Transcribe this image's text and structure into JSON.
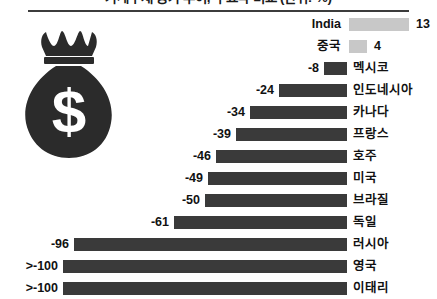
{
  "title": "가계부채 증가 추이, 주요국 비교 (단위: %)",
  "icon": {
    "money_bag": "money-bag-icon",
    "dollar_glyph": "$"
  },
  "axis": {
    "zero_x_px": 347,
    "px_per_unit_negative": 2.84,
    "px_per_unit_positive": 4.6
  },
  "colors": {
    "positive_bar": "#c8c8c8",
    "negative_bar": "#3a3a3a",
    "text": "#111111",
    "rule": "#3c3c3c",
    "background": "#ffffff"
  },
  "chart_data": {
    "type": "bar",
    "title": "가계부채 증가 추이, 주요국 비교 (단위: %)",
    "orientation": "horizontal",
    "xlabel": "",
    "ylabel": "",
    "grid": false,
    "legend": "none",
    "xlim": [
      -100,
      15
    ],
    "categories": [
      "India",
      "중국",
      "멕시코",
      "인도네시아",
      "카나다",
      "프랑스",
      "호주",
      "미국",
      "브라질",
      "독일",
      "러시아",
      "영국",
      "이태리"
    ],
    "values": [
      13,
      4,
      -8,
      -24,
      -34,
      -39,
      -46,
      -49,
      -50,
      -61,
      -96,
      -100,
      -100
    ],
    "value_labels": [
      "13",
      "4",
      "-8",
      "-24",
      "-34",
      "-39",
      "-46",
      "-49",
      "-50",
      "-61",
      "-96",
      ">-100",
      ">-100"
    ],
    "series": [
      {
        "name": "변화율",
        "values": [
          13,
          4,
          -8,
          -24,
          -34,
          -39,
          -46,
          -49,
          -50,
          -61,
          -96,
          -100,
          -100
        ]
      }
    ],
    "rows": [
      {
        "label": "India",
        "value": 13,
        "value_label": "13",
        "sign": "pos",
        "bar_px": 60
      },
      {
        "label": "중국",
        "value": 4,
        "value_label": "4",
        "sign": "pos",
        "bar_px": 18
      },
      {
        "label": "멕시코",
        "value": -8,
        "value_label": "-8",
        "sign": "neg",
        "bar_px": 23
      },
      {
        "label": "인도네시아",
        "value": -24,
        "value_label": "-24",
        "sign": "neg",
        "bar_px": 68
      },
      {
        "label": "카나다",
        "value": -34,
        "value_label": "-34",
        "sign": "neg",
        "bar_px": 97
      },
      {
        "label": "프랑스",
        "value": -39,
        "value_label": "-39",
        "sign": "neg",
        "bar_px": 111
      },
      {
        "label": "호주",
        "value": -46,
        "value_label": "-46",
        "sign": "neg",
        "bar_px": 131
      },
      {
        "label": "미국",
        "value": -49,
        "value_label": "-49",
        "sign": "neg",
        "bar_px": 139
      },
      {
        "label": "브라질",
        "value": -50,
        "value_label": "-50",
        "sign": "neg",
        "bar_px": 142
      },
      {
        "label": "독일",
        "value": -61,
        "value_label": "-61",
        "sign": "neg",
        "bar_px": 173
      },
      {
        "label": "러시아",
        "value": -96,
        "value_label": "-96",
        "sign": "neg",
        "bar_px": 273
      },
      {
        "label": "영국",
        "value": -100,
        "value_label": ">-100",
        "sign": "neg",
        "bar_px": 284
      },
      {
        "label": "이태리",
        "value": -100,
        "value_label": ">-100",
        "sign": "neg",
        "bar_px": 284
      }
    ]
  }
}
